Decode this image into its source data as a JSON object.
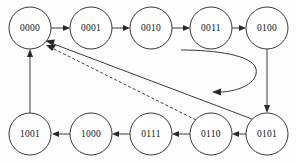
{
  "diagram": {
    "type": "state-machine",
    "background_color": "#fdfdfd",
    "stroke_color": "#3a3a3a",
    "label_color": "#111111",
    "nodes": [
      {
        "id": "n0000",
        "label": "0000",
        "cx": 30,
        "cy": 28,
        "r": 21
      },
      {
        "id": "n0001",
        "label": "0001",
        "cx": 91,
        "cy": 28,
        "r": 21
      },
      {
        "id": "n0010",
        "label": "0010",
        "cx": 151,
        "cy": 28,
        "r": 21
      },
      {
        "id": "n0011",
        "label": "0011",
        "cx": 211,
        "cy": 28,
        "r": 21
      },
      {
        "id": "n0100",
        "label": "0100",
        "cx": 267,
        "cy": 28,
        "r": 21
      },
      {
        "id": "n0101",
        "label": "0101",
        "cx": 267,
        "cy": 134,
        "r": 21
      },
      {
        "id": "n0110",
        "label": "0110",
        "cx": 211,
        "cy": 134,
        "r": 21
      },
      {
        "id": "n0111",
        "label": "0111",
        "cx": 151,
        "cy": 134,
        "r": 21
      },
      {
        "id": "n1000",
        "label": "1000",
        "cx": 91,
        "cy": 134,
        "r": 21
      },
      {
        "id": "n1001",
        "label": "1001",
        "cx": 30,
        "cy": 134,
        "r": 21
      }
    ],
    "edges": [
      {
        "id": "e1",
        "from": "0000",
        "to": "0001",
        "style": "solid",
        "direction": "right"
      },
      {
        "id": "e2",
        "from": "0001",
        "to": "0010",
        "style": "solid",
        "direction": "right"
      },
      {
        "id": "e3",
        "from": "0010",
        "to": "0011",
        "style": "solid",
        "direction": "right"
      },
      {
        "id": "e4",
        "from": "0011",
        "to": "0100",
        "style": "solid",
        "direction": "right"
      },
      {
        "id": "e5",
        "from": "0100",
        "to": "0101",
        "style": "solid",
        "direction": "down"
      },
      {
        "id": "e6",
        "from": "0101",
        "to": "0110",
        "style": "solid",
        "direction": "left"
      },
      {
        "id": "e7",
        "from": "0110",
        "to": "0111",
        "style": "solid",
        "direction": "left"
      },
      {
        "id": "e8",
        "from": "0111",
        "to": "1000",
        "style": "solid",
        "direction": "left"
      },
      {
        "id": "e9",
        "from": "1000",
        "to": "1001",
        "style": "solid",
        "direction": "left"
      },
      {
        "id": "e10",
        "from": "1001",
        "to": "0000",
        "style": "solid",
        "direction": "up"
      },
      {
        "id": "e11",
        "from": "0101",
        "to": "0000",
        "style": "solid",
        "direction": "diagonal-up-left"
      },
      {
        "id": "e12",
        "from": "0110",
        "to": "0000",
        "style": "dashed",
        "direction": "diagonal-up-left"
      },
      {
        "id": "e13",
        "from": "0100",
        "to": "loop",
        "style": "solid",
        "direction": "curved-hook"
      }
    ]
  }
}
